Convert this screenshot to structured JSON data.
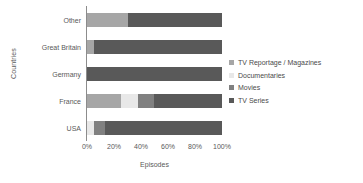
{
  "chart_data": {
    "type": "bar",
    "orientation": "horizontal",
    "stacked": true,
    "normalized": true,
    "title": "",
    "xlabel": "Episodes",
    "ylabel": "Countries",
    "xlim": [
      0,
      100
    ],
    "xticks": [
      0,
      20,
      40,
      60,
      80,
      100
    ],
    "xticklabels": [
      "0%",
      "20%",
      "40%",
      "60%",
      "80%",
      "100%"
    ],
    "grid": false,
    "legend_position": "right",
    "categories": [
      "Other",
      "Great Britain",
      "Germany",
      "France",
      "USA"
    ],
    "series": [
      {
        "name": "TV Series",
        "color": "#595959",
        "values": [
          70,
          95,
          100,
          50,
          87
        ]
      },
      {
        "name": "Movies",
        "color": "#808080",
        "values": [
          0,
          0,
          0,
          12,
          8
        ]
      },
      {
        "name": "Documentaries",
        "color": "#e8e8e8",
        "values": [
          0,
          0,
          0,
          13,
          5
        ]
      },
      {
        "name": "TV Reportage / Magazines",
        "color": "#a6a6a6",
        "values": [
          30,
          5,
          0,
          25,
          0
        ]
      }
    ]
  },
  "legend": {
    "items": [
      {
        "label": "TV Reportage / Magazines",
        "color": "#a6a6a6"
      },
      {
        "label": "Documentaries",
        "color": "#e8e8e8"
      },
      {
        "label": "Movies",
        "color": "#808080"
      },
      {
        "label": "TV Series",
        "color": "#595959"
      }
    ]
  }
}
